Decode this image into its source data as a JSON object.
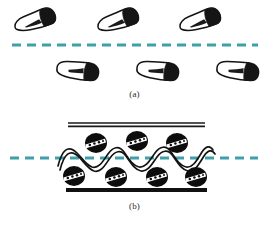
{
  "figure": {
    "type": "scientific-schematic-diagram",
    "background_color": "#ffffff",
    "width": 269,
    "height": 225
  },
  "colors": {
    "dashed_line": "#3f9faa",
    "outline": "#1a1a1a",
    "fill_dark": "#111111",
    "fill_light": "#ffffff",
    "caption_text": "#2b2b2b"
  },
  "panels": [
    {
      "id": "a",
      "caption": "(a)",
      "description": "dispersed irregular flake particles above and below an interface",
      "interface": {
        "name": "dashed-interface-line",
        "style": "dashed",
        "color": "#3f9faa",
        "y": 45,
        "x_start": 12,
        "x_end": 258,
        "dash_length": 9,
        "gap_length": 6,
        "thickness": 3
      },
      "particles": [
        {
          "row": "upper",
          "index": 1,
          "cx": 35,
          "cy": 20,
          "rotation": -12
        },
        {
          "row": "upper",
          "index": 2,
          "cx": 118,
          "cy": 20,
          "rotation": -12
        },
        {
          "row": "upper",
          "index": 3,
          "cx": 200,
          "cy": 20,
          "rotation": -12
        },
        {
          "row": "lower",
          "index": 1,
          "cx": 78,
          "cy": 70,
          "rotation": 8
        },
        {
          "row": "lower",
          "index": 2,
          "cx": 158,
          "cy": 70,
          "rotation": 8
        },
        {
          "row": "lower",
          "index": 3,
          "cx": 238,
          "cy": 70,
          "rotation": 8
        }
      ]
    },
    {
      "id": "b",
      "caption": "(b)",
      "description": "particles confined in a channel with an undulating membrane crossing the interface",
      "interface": {
        "name": "dashed-interface-line",
        "style": "dashed",
        "color": "#3f9faa",
        "y": 158,
        "x_start": 10,
        "x_end": 258,
        "dash_length": 9,
        "gap_length": 6,
        "thickness": 3
      },
      "top_wall": {
        "name": "top-wall-double-line",
        "x_start": 68,
        "x_end": 205,
        "y": 124,
        "style": "double-thin",
        "color": "#1a1a1a"
      },
      "bottom_wall": {
        "name": "bottom-wall-thick-bar",
        "x_start": 66,
        "x_end": 207,
        "y": 190,
        "style": "solid-thick",
        "color": "#111111",
        "thickness": 4
      },
      "wave": {
        "name": "undulating-membrane",
        "style": "double-stroke-sinusoid",
        "x_start": 58,
        "x_end": 214,
        "baseline_y": 158,
        "amplitude": 9,
        "wavelength": 39,
        "color": "#1a1a1a"
      },
      "particles_upper": [
        {
          "index": 1,
          "cx": 96,
          "cy": 143,
          "rx": 11,
          "ry": 10
        },
        {
          "index": 2,
          "cx": 137,
          "cy": 141,
          "rx": 11,
          "ry": 10
        },
        {
          "index": 3,
          "cx": 177,
          "cy": 143,
          "rx": 11,
          "ry": 10
        }
      ],
      "particles_lower": [
        {
          "index": 1,
          "cx": 74,
          "cy": 176,
          "rx": 11,
          "ry": 10
        },
        {
          "index": 2,
          "cx": 116,
          "cy": 177,
          "rx": 11,
          "ry": 10
        },
        {
          "index": 3,
          "cx": 157,
          "cy": 177,
          "rx": 11,
          "ry": 10
        },
        {
          "index": 4,
          "cx": 196,
          "cy": 177,
          "rx": 11,
          "ry": 10
        }
      ]
    }
  ]
}
